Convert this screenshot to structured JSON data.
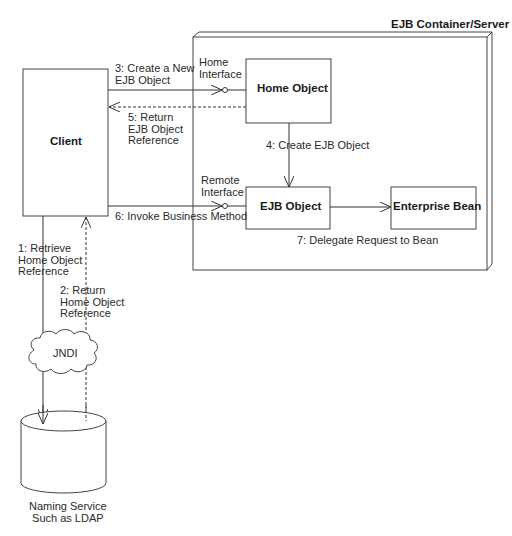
{
  "diagram": {
    "container": {
      "title": "EJB Container/Server"
    },
    "nodes": {
      "client": "Client",
      "home_object": "Home Object",
      "ejb_object": "EJB Object",
      "enterprise_bean": "Enterprise Bean",
      "jndi": "JNDI",
      "naming_service": [
        "Naming Service",
        "Such as LDAP"
      ]
    },
    "interfaces": {
      "home": [
        "Home",
        "Interface"
      ],
      "remote": [
        "Remote",
        "Interface"
      ]
    },
    "messages": {
      "m1": [
        "1: Retrieve",
        "Home Object",
        "Reference"
      ],
      "m2": [
        "2: Return",
        "Home Object",
        "Reference"
      ],
      "m3": [
        "3: Create a New",
        "EJB Object"
      ],
      "m4": "4: Create EJB Object",
      "m5": [
        "5: Return",
        "EJB Object",
        "Reference"
      ],
      "m6": "6: Invoke Business Method",
      "m7": "7: Delegate Request to Bean"
    },
    "colors": {
      "line": "#333333",
      "background": "#ffffff"
    }
  }
}
